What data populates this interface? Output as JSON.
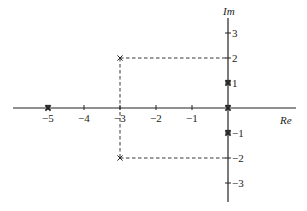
{
  "diagram": {
    "type": "complex-plane-pole-plot",
    "axes": {
      "real_label": "Re",
      "imag_label": "Im",
      "real_ticks": [
        {
          "value": -5,
          "label": "−5"
        },
        {
          "value": -4,
          "label": "−4"
        },
        {
          "value": -3,
          "label": "−3"
        },
        {
          "value": -2,
          "label": "−2"
        },
        {
          "value": -1,
          "label": "−1"
        }
      ],
      "imag_ticks": [
        {
          "value": 3,
          "label": "3"
        },
        {
          "value": 2,
          "label": "2"
        },
        {
          "value": 1,
          "label": "1"
        },
        {
          "value": -1,
          "label": "−1"
        },
        {
          "value": -2,
          "label": "−2"
        },
        {
          "value": -3,
          "label": "−3"
        }
      ]
    },
    "poles": [
      {
        "re": -5,
        "im": 0,
        "bold": true
      },
      {
        "re": -3,
        "im": 2,
        "bold": false
      },
      {
        "re": -3,
        "im": -2,
        "bold": false
      },
      {
        "re": 0,
        "im": 1,
        "bold": true
      },
      {
        "re": 0,
        "im": 0,
        "bold": true
      },
      {
        "re": 0,
        "im": -1,
        "bold": true
      }
    ],
    "dashed_guides": [
      {
        "from": {
          "re": -3,
          "im": 2
        },
        "to": {
          "re": 0,
          "im": 2
        }
      },
      {
        "from": {
          "re": -3,
          "im": -2
        },
        "to": {
          "re": 0,
          "im": -2
        }
      },
      {
        "from": {
          "re": -3,
          "im": 2
        },
        "to": {
          "re": -3,
          "im": -2
        }
      }
    ],
    "colors": {
      "ink": "#222222",
      "background": "#ffffff"
    }
  }
}
